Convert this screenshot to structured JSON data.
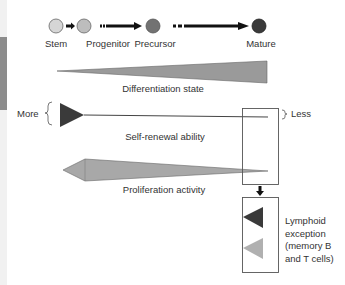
{
  "stages": [
    {
      "label": "Stem",
      "color": "#d6d6d6"
    },
    {
      "label": "Progenitor",
      "color": "#bdbdbd"
    },
    {
      "label": "Precursor",
      "color": "#727272"
    },
    {
      "label": "Mature",
      "color": "#3a3a3a"
    }
  ],
  "gradients": {
    "differentiation": {
      "label": "Differentiation state",
      "color": "#9a9a9a"
    },
    "self_renewal": {
      "label": "Self-renewal ability",
      "more_label": "More",
      "less_label": "Less",
      "color": "#3a3a3a"
    },
    "proliferation": {
      "label": "Proliferation activity",
      "color": "#a8a8a8"
    }
  },
  "exception": {
    "label": "Lymphoid exception (memory B and T cells)",
    "lines": [
      "Lymphoid",
      "exception",
      "(memory B",
      "and T cells)"
    ],
    "dark_color": "#3a3a3a",
    "light_color": "#b0b0b0"
  }
}
